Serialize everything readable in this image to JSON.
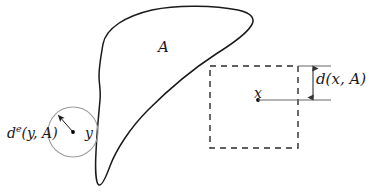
{
  "figure": {
    "background_color": "#ffffff",
    "width": 387,
    "height": 192
  },
  "labels": {
    "set_label": "A",
    "point_x_label": "x",
    "point_y_label": "y",
    "distance_x_label": "d(x, A)",
    "excess_distance_y_label_base": "d",
    "excess_distance_y_label_sup": "e",
    "excess_distance_y_label_rest": "(y, A)",
    "excess_distance_y_label_full": "d^e(y, A)"
  },
  "colors": {
    "blob_stroke": "#1a1a1a",
    "circle_stroke": "#9a9a9a",
    "dashed_stroke": "#2b2b2b",
    "measure_stroke": "#555555",
    "point_fill": "#000000",
    "text": "#1a1a1a"
  },
  "geometry": {
    "dashed_square": {
      "x": 210,
      "y": 66,
      "width": 88,
      "height": 82
    },
    "circle": {
      "cx": 73,
      "cy": 132,
      "r": 25
    },
    "point_x": {
      "cx": 258,
      "cy": 100
    },
    "point_y": {
      "cx": 73,
      "cy": 132
    },
    "distance_arrow": {
      "x": 313,
      "y_top": 66,
      "y_bottom": 100
    },
    "tick_top": {
      "x1": 298,
      "x2": 330,
      "y": 66
    },
    "tick_bottom": {
      "x1": 258,
      "x2": 330,
      "y": 100
    },
    "radius_arrow": {
      "x1": 73,
      "y1": 132,
      "x2": 57,
      "y2": 114
    }
  }
}
